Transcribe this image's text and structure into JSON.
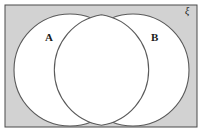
{
  "figure": {
    "type": "venn-diagram",
    "canvas": {
      "width": 203,
      "height": 133
    },
    "colors": {
      "page_background": "#ffffff",
      "universal_set_fill": "#d2d2d2",
      "universal_set_stroke": "#4a4a4a",
      "circle_fill": "#ffffff",
      "circle_stroke": "#5a5a5a",
      "label_color": "#1a1a1a"
    },
    "universal_set": {
      "symbol": "ξ",
      "symbol_name": "xi",
      "x": 5,
      "y": 5,
      "width": 192,
      "height": 122,
      "stroke_width": 1
    },
    "sets": [
      {
        "label": "A",
        "cx": 70,
        "cy": 70,
        "r": 56,
        "stroke_width": 1.1,
        "label_x": 45,
        "label_y": 32
      },
      {
        "label": "B",
        "cx": 133,
        "cy": 70,
        "r": 56,
        "stroke_width": 1.1,
        "label_x": 151,
        "label_y": 32
      }
    ]
  }
}
